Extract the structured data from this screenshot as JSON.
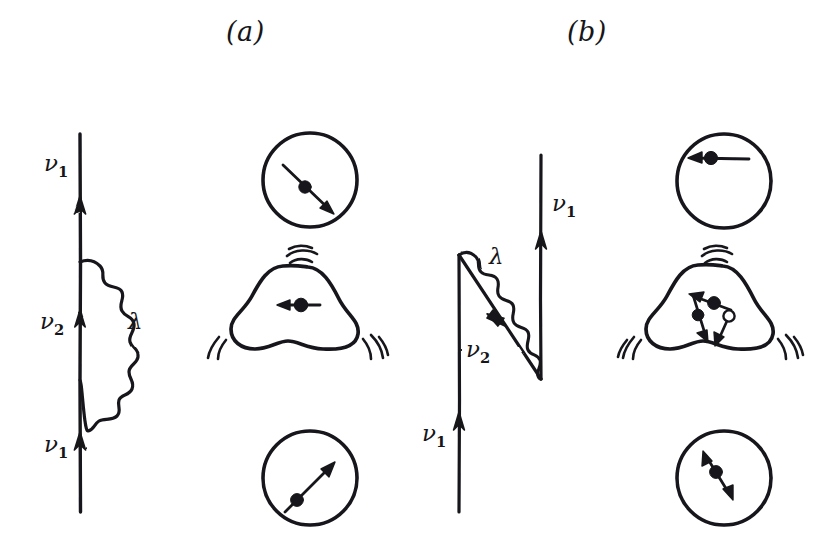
{
  "figure": {
    "background_color": "#ffffff",
    "ink_color": "#16161a",
    "width": 828,
    "height": 550
  },
  "panels": [
    {
      "id": "a",
      "label": "(a)",
      "diagram": {
        "type": "self-energy-loop",
        "description": "Single vertical upward fermion line with a wavy boson loop emitted and reabsorbed on the same line",
        "line_labels": [
          {
            "name": "nu1-top",
            "text": "ν",
            "sub": "1"
          },
          {
            "name": "nu2-middle",
            "text": "ν",
            "sub": "2"
          },
          {
            "name": "nu1-bottom",
            "text": "ν",
            "sub": "1"
          }
        ],
        "boson_label": {
          "name": "lambda",
          "text": "λ"
        }
      },
      "schematics": [
        {
          "name": "nucleus-spherical-top",
          "shape": "circle",
          "arrow_direction": "down-right",
          "arrow_style": "single-headed",
          "marker": "filled-dot",
          "vibrating": false
        },
        {
          "name": "nucleus-deformed-middle",
          "shape": "deformed-triangular",
          "arrow_direction": "left",
          "arrow_style": "single-headed",
          "marker": "filled-dot",
          "vibrating": true
        },
        {
          "name": "nucleus-spherical-bottom",
          "shape": "circle",
          "arrow_direction": "up-right",
          "arrow_style": "single-headed",
          "marker": "filled-dot",
          "vibrating": false
        }
      ]
    },
    {
      "id": "b",
      "label": "(b)",
      "diagram": {
        "type": "exchange-triangle",
        "description": "Vertical upward line, diagonal downward-right line, and a wavy boson line closing the triangle onto a second vertical upward line",
        "line_labels": [
          {
            "name": "nu1-top",
            "text": "ν",
            "sub": "1"
          },
          {
            "name": "nu2-diagonal",
            "text": "ν",
            "sub": "2"
          },
          {
            "name": "nu1-bottom",
            "text": "ν",
            "sub": "1"
          }
        ],
        "boson_label": {
          "name": "lambda",
          "text": "λ"
        }
      },
      "schematics": [
        {
          "name": "nucleus-spherical-top",
          "shape": "circle",
          "arrow_direction": "left",
          "arrow_style": "single-headed",
          "marker": "filled-dot",
          "vibrating": false
        },
        {
          "name": "nucleus-deformed-middle",
          "shape": "deformed-triangular",
          "arrow_directions": [
            "up-left",
            "down-left",
            "down-right"
          ],
          "arrow_style": "single-headed",
          "markers": [
            "filled-dot",
            "filled-dot",
            "open-dot"
          ],
          "vibrating": true
        },
        {
          "name": "nucleus-spherical-bottom",
          "shape": "circle",
          "arrow_direction": "up-left-down-right",
          "arrow_style": "double-headed",
          "marker": "filled-dot",
          "vibrating": false
        }
      ]
    }
  ]
}
